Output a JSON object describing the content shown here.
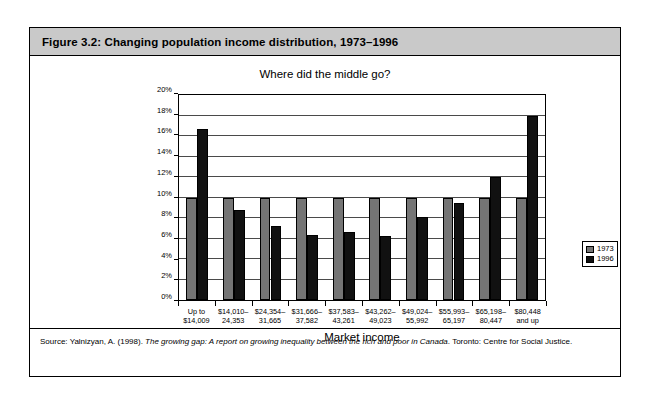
{
  "figure": {
    "caption": "Figure 3.2: Changing population income distribution, 1973–1996",
    "source_prefix": "Source: Yalnizyan, A. (1998). ",
    "source_italic": "The growing gap: A report on growing inequality between the rich and poor in Canada",
    "source_suffix": ". Toronto: Centre for Social Justice."
  },
  "legend": {
    "position": "right",
    "items": [
      {
        "label": "1973",
        "color": "#757575"
      },
      {
        "label": "1996",
        "color": "#111111"
      }
    ]
  },
  "chart_data": {
    "type": "bar",
    "title": "Where did the middle go?",
    "xlabel": "Market income",
    "ylabel": "",
    "ylim": [
      0,
      20
    ],
    "ytick_values": [
      0,
      2,
      4,
      6,
      8,
      10,
      12,
      14,
      16,
      18,
      20
    ],
    "ytick_labels": [
      "0%",
      "2%",
      "4%",
      "6%",
      "8%",
      "10%",
      "12%",
      "14%",
      "16%",
      "18%",
      "20%"
    ],
    "grid": true,
    "categories": [
      "Up to\n$14,009",
      "$14,010–\n24,353",
      "$24,354–\n31,665",
      "$31,666–\n37,582",
      "$37,583–\n43,261",
      "$43,262–\n49,023",
      "$49,024–\n55,992",
      "$55,993–\n65,197",
      "$65,198–\n80,447",
      "$80,448\nand up"
    ],
    "category_lines": [
      [
        "Up to",
        "$14,009"
      ],
      [
        "$14,010–",
        "24,353"
      ],
      [
        "$24,354–",
        "31,665"
      ],
      [
        "$31,666–",
        "37,582"
      ],
      [
        "$37,583–",
        "43,261"
      ],
      [
        "$43,262–",
        "49,023"
      ],
      [
        "$49,024–",
        "55,992"
      ],
      [
        "$55,993–",
        "65,197"
      ],
      [
        "$65,198–",
        "80,447"
      ],
      [
        "$80,448",
        "and up"
      ]
    ],
    "series": [
      {
        "name": "1973",
        "color": "#757575",
        "values": [
          10,
          10,
          10,
          10,
          10,
          10,
          10,
          10,
          10,
          10
        ]
      },
      {
        "name": "1996",
        "color": "#111111",
        "values": [
          16.7,
          8.8,
          7.2,
          6.3,
          6.6,
          6.2,
          8.1,
          9.5,
          12.0,
          18.0
        ]
      }
    ]
  }
}
